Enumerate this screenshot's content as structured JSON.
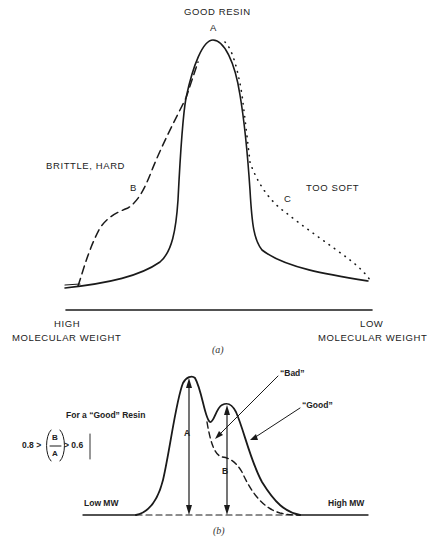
{
  "panel_a": {
    "title": "GOOD RESIN",
    "peak_label": "A",
    "left_annotation": "BRITTLE, HARD",
    "curve_b_label": "B",
    "right_annotation": "TOO SOFT",
    "curve_c_label": "C",
    "x_axis_left_line1": "HIGH",
    "x_axis_left_line2": "MOLECULAR WEIGHT",
    "x_axis_right_line1": "LOW",
    "x_axis_right_line2": "MOLECULAR WEIGHT",
    "caption": "(a)",
    "curves": [
      {
        "id": "A",
        "style": "solid",
        "meaning": "Good resin"
      },
      {
        "id": "B",
        "style": "dashed",
        "meaning": "Brittle, hard"
      },
      {
        "id": "C",
        "style": "dotted",
        "meaning": "Too soft"
      }
    ]
  },
  "panel_b": {
    "rule_title": "For a “Good” Resin",
    "rule_lhs": "0.8 >",
    "rule_numerator": "B",
    "rule_denominator": "A",
    "rule_rhs": "> 0.6",
    "peak_a_label": "A",
    "peak_b_label": "B",
    "bad_label": "“Bad”",
    "good_label": "“Good”",
    "x_left_label": "Low MW",
    "x_right_label": "High MW",
    "caption": "(b)",
    "curves": [
      {
        "id": "good",
        "style": "solid",
        "meaning": "Good resin, bimodal"
      },
      {
        "id": "bad",
        "style": "dashed",
        "meaning": "Bad resin, shoulder"
      }
    ]
  },
  "colors": {
    "ink": "#1a1a1a",
    "background": "#ffffff"
  }
}
